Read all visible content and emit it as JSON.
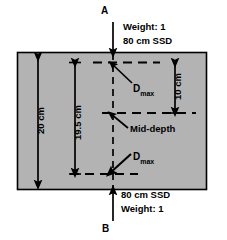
{
  "figure": {
    "type": "diagram",
    "phantom": {
      "fill_color": "#b3b3b3",
      "border_color": "#000000",
      "thickness_label": "20 cm"
    },
    "beams": {
      "top": {
        "field_letter": "A",
        "weight_label": "Weight: 1",
        "ssd_label": "80 cm SSD",
        "direction": "down"
      },
      "bottom": {
        "field_letter": "B",
        "weight_label": "Weight: 1",
        "ssd_label": "80 cm SSD",
        "direction": "up"
      }
    },
    "depth_markers": [
      {
        "label": "D",
        "subscript": "max",
        "position": "upper"
      },
      {
        "label": "Mid-depth",
        "subscript": "",
        "position": "center"
      },
      {
        "label": "D",
        "subscript": "max",
        "position": "lower"
      }
    ],
    "dimensions": [
      {
        "name": "phantom-thickness",
        "label": "20 cm",
        "orientation": "vertical",
        "side": "far-left"
      },
      {
        "name": "dmax-to-dmax-separation",
        "label": "19.5 cm",
        "orientation": "vertical",
        "side": "inner-left"
      },
      {
        "name": "dmax-to-middepth",
        "label": "10 cm",
        "orientation": "vertical",
        "side": "right"
      }
    ]
  }
}
